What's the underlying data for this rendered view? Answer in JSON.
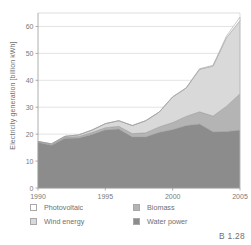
{
  "caption": "B 1.28",
  "axis": {
    "ylabel": "Electricity generation [billion kWh]",
    "yticks": [
      "0",
      "10",
      "20",
      "30",
      "40",
      "50",
      "60"
    ],
    "xticks": [
      "1990",
      "1995",
      "2000",
      "2005"
    ]
  },
  "legend": {
    "items": [
      {
        "label": "Photovoltaic",
        "color": "#ffffff",
        "key": "photovoltaic"
      },
      {
        "label": "Wind energy",
        "color": "#d9d9d9",
        "key": "wind-energy"
      },
      {
        "label": "Biomass",
        "color": "#b4b4b4",
        "key": "biomass"
      },
      {
        "label": "Water power",
        "color": "#8c8c8c",
        "key": "water-power"
      }
    ]
  },
  "chart_data": {
    "type": "area",
    "title": "",
    "subtitle": "",
    "xlabel": "",
    "ylabel": "Electricity generation [billion kWh]",
    "stacked": true,
    "grid": true,
    "legend_position": "bottom",
    "xlim": [
      1990,
      2005
    ],
    "ylim": [
      0,
      65
    ],
    "yticks": [
      0,
      10,
      20,
      30,
      40,
      50,
      60
    ],
    "xticks": [
      1990,
      1995,
      2000,
      2005
    ],
    "x": [
      1990,
      1991,
      1992,
      1993,
      1994,
      1995,
      1996,
      1997,
      1998,
      1999,
      2000,
      2001,
      2002,
      2003,
      2004,
      2005
    ],
    "series": [
      {
        "name": "Water power",
        "color": "#8c8c8c",
        "values": [
          17.0,
          15.9,
          18.5,
          18.6,
          19.9,
          21.6,
          21.9,
          19.0,
          19.0,
          20.7,
          21.7,
          23.2,
          23.8,
          20.9,
          21.0,
          21.5
        ]
      },
      {
        "name": "Biomass",
        "color": "#b4b4b4",
        "values": [
          0.2,
          0.3,
          0.4,
          0.5,
          0.7,
          0.8,
          1.0,
          1.2,
          1.5,
          2.0,
          2.6,
          3.4,
          4.5,
          5.8,
          9.4,
          13.5
        ]
      },
      {
        "name": "Wind energy",
        "color": "#d9d9d9",
        "values": [
          0.1,
          0.2,
          0.3,
          0.6,
          0.9,
          1.5,
          2.1,
          3.0,
          4.5,
          5.5,
          9.5,
          10.5,
          15.8,
          18.6,
          25.5,
          27.2
        ]
      },
      {
        "name": "Photovoltaic",
        "color": "#ffffff",
        "values": [
          0.0,
          0.0,
          0.0,
          0.0,
          0.0,
          0.0,
          0.0,
          0.0,
          0.0,
          0.0,
          0.1,
          0.1,
          0.2,
          0.3,
          0.6,
          1.3
        ]
      }
    ],
    "totals": [
      17.3,
      16.4,
      19.2,
      19.7,
      21.5,
      23.9,
      25.0,
      23.2,
      25.0,
      28.2,
      33.9,
      37.2,
      44.3,
      45.6,
      56.5,
      63.5
    ]
  }
}
